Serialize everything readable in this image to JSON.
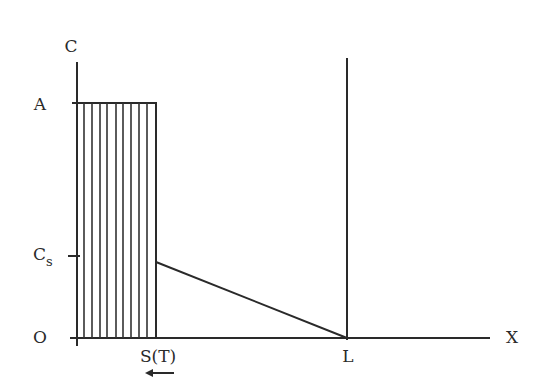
{
  "diagram": {
    "type": "concentration-profile",
    "axes": {
      "y_label": "C",
      "x_label": "X",
      "origin_label": "O"
    },
    "y_ticks": [
      {
        "label": "A",
        "meaning": "initial concentration level"
      },
      {
        "label": "C",
        "subscript": "s",
        "meaning": "surface concentration"
      }
    ],
    "x_ticks": [
      {
        "label": "S(T)",
        "meaning": "moving boundary position"
      },
      {
        "label": "L",
        "meaning": "domain length"
      }
    ],
    "annotations": {
      "arrow": "left-pointing arrow under S(T) indicating boundary moves left"
    },
    "colors": {
      "ink": "#2a2a2a",
      "background": "#ffffff"
    }
  }
}
